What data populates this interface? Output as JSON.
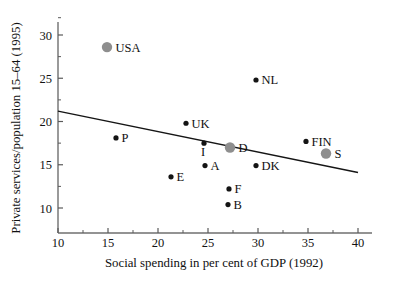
{
  "chart_data": {
    "type": "scatter",
    "title": "",
    "xlabel": "Social spending in per cent of GDP (1992)",
    "ylabel": "Private services/population 15–64 (1995)",
    "xlim": [
      10,
      40
    ],
    "ylim": [
      8.2,
      32.2
    ],
    "grid": false,
    "legend": "none",
    "x_ticks": [
      {
        "value": 10,
        "label": "10"
      },
      {
        "value": 15,
        "label": "15"
      },
      {
        "value": 20,
        "label": "20"
      },
      {
        "value": 25,
        "label": "25"
      },
      {
        "value": 30,
        "label": "30"
      },
      {
        "value": 35,
        "label": "35"
      },
      {
        "value": 40,
        "label": "40"
      }
    ],
    "x_minor_ticks": [
      12.5,
      17.5,
      22.5,
      27.5,
      32.5,
      37.5
    ],
    "y_ticks": [
      {
        "value": 10,
        "label": "10"
      },
      {
        "value": 15,
        "label": "15"
      },
      {
        "value": 20,
        "label": "20"
      },
      {
        "value": 25,
        "label": "25"
      },
      {
        "value": 30,
        "label": "30"
      }
    ],
    "y_minor_ticks": [
      12.5,
      17.5,
      22.5,
      27.5,
      32.0
    ],
    "points": [
      {
        "label": "USA",
        "x": 14.9,
        "y": 28.6,
        "style": "gray",
        "label_pos": "right"
      },
      {
        "label": "NL",
        "x": 29.8,
        "y": 24.8,
        "style": "black",
        "label_pos": "right"
      },
      {
        "label": "UK",
        "x": 22.8,
        "y": 19.8,
        "style": "black",
        "label_pos": "right"
      },
      {
        "label": "P",
        "x": 15.8,
        "y": 18.1,
        "style": "black",
        "label_pos": "right"
      },
      {
        "label": "FIN",
        "x": 34.8,
        "y": 17.7,
        "style": "black",
        "label_pos": "right"
      },
      {
        "label": "I",
        "x": 24.6,
        "y": 17.5,
        "style": "black",
        "label_pos": "below"
      },
      {
        "label": "D",
        "x": 27.2,
        "y": 17.0,
        "style": "gray",
        "label_pos": "right"
      },
      {
        "label": "S",
        "x": 36.8,
        "y": 16.3,
        "style": "gray",
        "label_pos": "right"
      },
      {
        "label": "A",
        "x": 24.7,
        "y": 14.9,
        "style": "black",
        "label_pos": "right"
      },
      {
        "label": "DK",
        "x": 29.8,
        "y": 14.9,
        "style": "black",
        "label_pos": "right"
      },
      {
        "label": "E",
        "x": 21.3,
        "y": 13.6,
        "style": "black",
        "label_pos": "right"
      },
      {
        "label": "F",
        "x": 27.1,
        "y": 12.2,
        "style": "black",
        "label_pos": "right"
      },
      {
        "label": "B",
        "x": 27.0,
        "y": 10.4,
        "style": "black",
        "label_pos": "right"
      }
    ],
    "trend_line": {
      "x_start": 10,
      "y_start": 21.2,
      "x_end": 40,
      "y_end": 14.1
    },
    "colors": {
      "marker_black": "#141414",
      "marker_gray": "#8e8e8e",
      "trend": "#151515",
      "axis": "#6f6f6f",
      "background": "#ffffff"
    }
  }
}
